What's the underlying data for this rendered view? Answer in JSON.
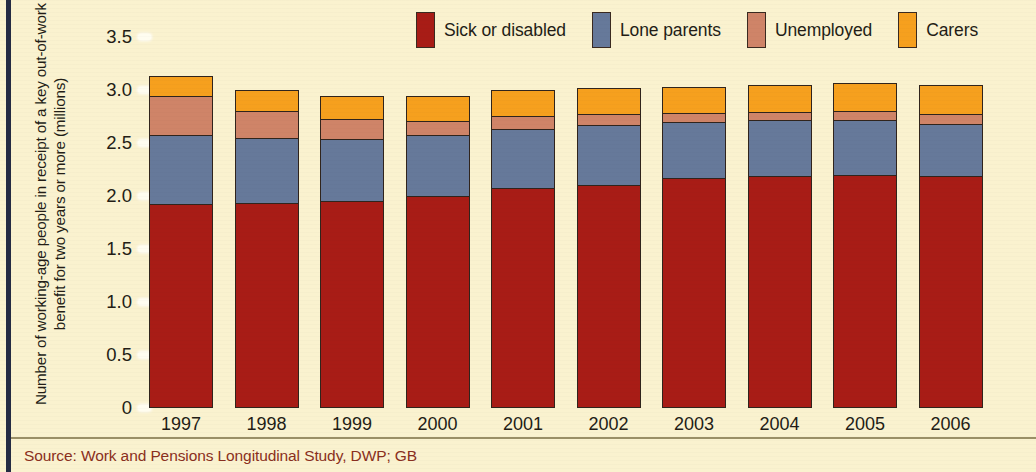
{
  "figure": {
    "background_color": "#faf2cf",
    "border_color": "#242b43",
    "source_note": "Source: Work and Pensions Longitudinal Study, DWP; GB",
    "source_color": "#8a2f20"
  },
  "legend": {
    "position": "top-right",
    "entries": [
      {
        "label": "Sick or disabled",
        "color": "#a81c16",
        "swatch_icon": "legend-swatch-icon"
      },
      {
        "label": "Lone parents",
        "color": "#66799a",
        "swatch_icon": "legend-swatch-icon"
      },
      {
        "label": "Unemployed",
        "color": "#cf8468",
        "swatch_icon": "legend-swatch-icon"
      },
      {
        "label": "Carers",
        "color": "#f6a01e",
        "swatch_icon": "legend-swatch-icon"
      }
    ]
  },
  "axes": {
    "ylabel": "Number of working-age people in receipt of a key out-of-work benefit for two years or more (millions)",
    "yticks": [
      "3.5",
      "3.0",
      "2.5",
      "2.0",
      "1.5",
      "1.0",
      "0.5",
      "0"
    ]
  },
  "chart_data": {
    "type": "bar",
    "stacked": true,
    "title": "",
    "subtitle": "",
    "xlabel": "",
    "ylabel": "Number of working-age people in receipt of a key out-of-work benefit for two years or more (millions)",
    "ylim": [
      0,
      3.5
    ],
    "ytick_values": [
      0,
      0.5,
      1.0,
      1.5,
      2.0,
      2.5,
      3.0,
      3.5
    ],
    "grid": false,
    "legend_position": "top-right",
    "units": "millions of people",
    "categories": [
      "1997",
      "1998",
      "1999",
      "2000",
      "2001",
      "2002",
      "2003",
      "2004",
      "2005",
      "2006"
    ],
    "series": [
      {
        "name": "Sick or disabled",
        "color": "#a81c16",
        "values": [
          1.93,
          1.94,
          1.96,
          2.0,
          2.08,
          2.11,
          2.17,
          2.19,
          2.2,
          2.19
        ]
      },
      {
        "name": "Lone parents",
        "color": "#66799a",
        "values": [
          0.65,
          0.61,
          0.58,
          0.58,
          0.56,
          0.57,
          0.54,
          0.53,
          0.52,
          0.5
        ]
      },
      {
        "name": "Unemployed",
        "color": "#cf8468",
        "values": [
          0.37,
          0.26,
          0.19,
          0.14,
          0.12,
          0.1,
          0.08,
          0.08,
          0.09,
          0.09
        ]
      },
      {
        "name": "Carers",
        "color": "#f6a01e",
        "values": [
          0.18,
          0.19,
          0.21,
          0.22,
          0.24,
          0.24,
          0.24,
          0.25,
          0.26,
          0.27
        ]
      }
    ],
    "totals": [
      3.13,
      3.0,
      2.94,
      2.94,
      3.0,
      3.02,
      3.03,
      3.05,
      3.07,
      3.05
    ]
  }
}
